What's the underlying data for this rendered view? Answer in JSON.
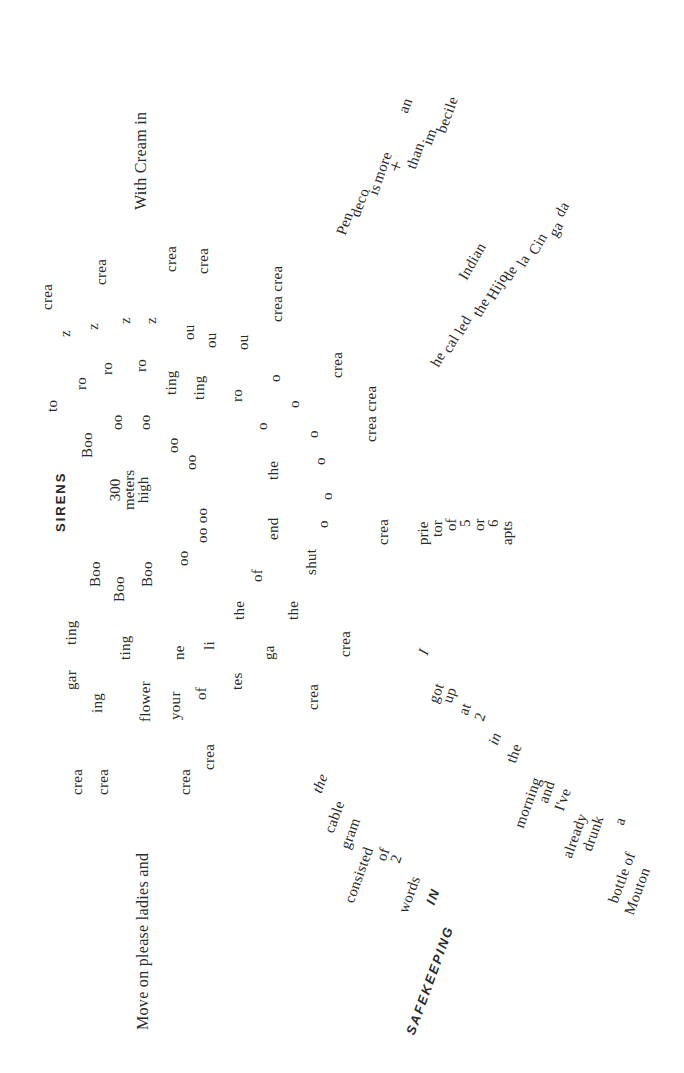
{
  "poem": {
    "lines": {
      "move_on": "Move on please ladies and",
      "with_cream": "With Cream in",
      "sirens": "SIRENS",
      "safekeeping_in": "IN",
      "safekeeping": "SAFEKEEPING"
    },
    "words": {
      "crea": "crea",
      "gar": "gar",
      "ing": "ing",
      "ting": "ting",
      "flower": "flower",
      "your": "your",
      "ne": "ne",
      "of": "of",
      "li": "li",
      "tes": "tes",
      "the": "the",
      "ga": "ga",
      "end": "end",
      "shut": "shut",
      "boo_cap": "Boo",
      "oo": "oo",
      "oo_oo": "oo oo",
      "o": "o",
      "ro": "ro",
      "z": "z",
      "to": "to",
      "ou": "ou",
      "crea_crea": "crea crea"
    },
    "height_stack": [
      "300",
      "meters",
      "high"
    ],
    "prietor_stack": [
      "prie",
      "tor",
      "of",
      "5",
      "or",
      "6",
      "apts"
    ],
    "cablegram_cascade": [
      "the",
      "cable",
      "gram",
      "consisted",
      "of",
      "2",
      "words"
    ],
    "morning_cascade": [
      "I",
      "got",
      "up",
      "at",
      "2",
      "in",
      "the",
      "morning",
      "and",
      "I've",
      "already",
      "drunk",
      "a",
      "bottle of",
      "Mouton"
    ],
    "hijo_cascade": [
      "he",
      "cal",
      "led",
      "the",
      "Indian",
      "Hijo",
      "de",
      "la",
      "Cin",
      "ga",
      "da"
    ],
    "pen_cascade": [
      "Pen",
      "deco",
      "is",
      "more",
      "+",
      "than",
      "an",
      "im",
      "becile"
    ]
  }
}
